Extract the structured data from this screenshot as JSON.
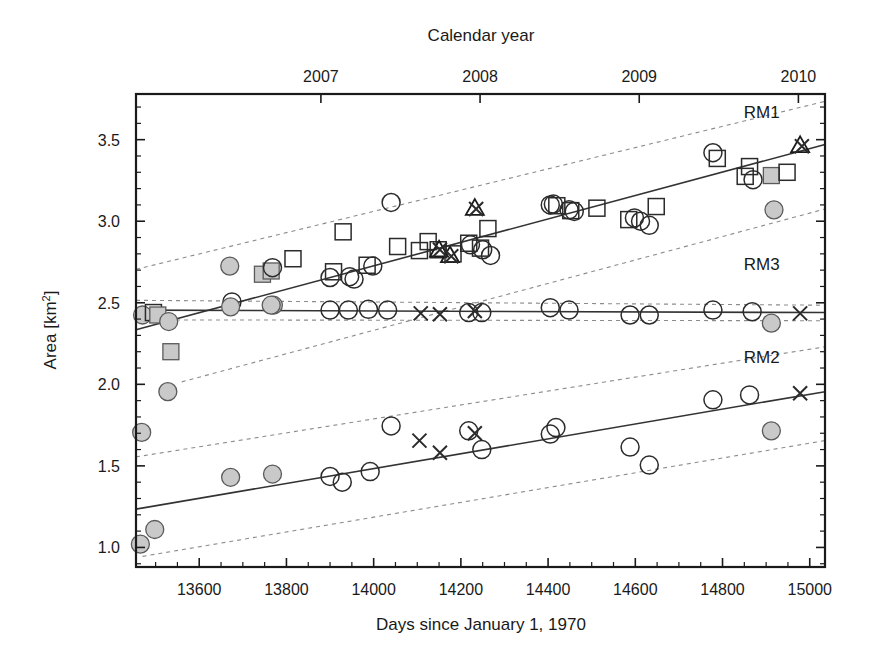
{
  "figure": {
    "background": "#ffffff",
    "ink_color": "#1a1a1a",
    "marker_fill_color": "#c9c9c9",
    "fit_line_color": "#333333",
    "ci_line_color": "#8c8c8c"
  },
  "chart_data": {
    "type": "scatter",
    "title": "",
    "xlabel": "Days since January 1, 1970",
    "ylabel": "Area [km²]",
    "top_axis_label": "Calendar year",
    "xlim": [
      13455,
      15035
    ],
    "ylim": [
      0.88,
      3.78
    ],
    "grid": false,
    "legend_position": "inline-right",
    "x_ticks_major": [
      13600,
      13800,
      14000,
      14200,
      14400,
      14600,
      14800,
      15000
    ],
    "x_tick_labels": [
      "13600",
      "13800",
      "14000",
      "14200",
      "14400",
      "14600",
      "14800",
      "15000"
    ],
    "x_minor_step": 50,
    "y_ticks_major": [
      1.0,
      1.5,
      2.0,
      2.5,
      3.0,
      3.5
    ],
    "y_tick_labels": [
      "1.0",
      "1.5",
      "2.0",
      "2.5",
      "3.0",
      "3.5"
    ],
    "y_minor_step": 0.1,
    "top_ticks": [
      13879,
      14244,
      14609,
      14974
    ],
    "top_tick_labels": [
      "2007",
      "2008",
      "2009",
      "2010"
    ],
    "series": [
      {
        "name": "RM1",
        "label": "RM1",
        "label_x": 14890,
        "label_y": 3.63,
        "fit": {
          "x1": 13455,
          "y1": 2.335,
          "x2": 15035,
          "y2": 3.47
        },
        "ci_upper": {
          "x1": 13455,
          "y1": 2.705,
          "x2": 15035,
          "y2": 3.735
        },
        "ci_lower": {
          "x1": 13560,
          "y1": 2.015,
          "x2": 15035,
          "y2": 3.075
        },
        "points": [
          {
            "x": 13470,
            "y": 2.425,
            "marker": "filled-circle"
          },
          {
            "x": 13495,
            "y": 2.44,
            "marker": "open-square"
          },
          {
            "x": 13505,
            "y": 2.425,
            "marker": "filled-square"
          },
          {
            "x": 13530,
            "y": 2.385,
            "marker": "filled-circle"
          },
          {
            "x": 13535,
            "y": 2.2,
            "marker": "filled-square"
          },
          {
            "x": 13670,
            "y": 2.725,
            "marker": "filled-circle"
          },
          {
            "x": 13675,
            "y": 2.505,
            "marker": "open-circle"
          },
          {
            "x": 13745,
            "y": 2.675,
            "marker": "filled-square"
          },
          {
            "x": 13765,
            "y": 2.695,
            "marker": "filled-square"
          },
          {
            "x": 13768,
            "y": 2.715,
            "marker": "open-circle"
          },
          {
            "x": 13770,
            "y": 2.485,
            "marker": "filled-circle"
          },
          {
            "x": 13815,
            "y": 2.77,
            "marker": "open-square"
          },
          {
            "x": 13900,
            "y": 2.655,
            "marker": "open-circle"
          },
          {
            "x": 13908,
            "y": 2.69,
            "marker": "open-square"
          },
          {
            "x": 13930,
            "y": 2.935,
            "marker": "open-square"
          },
          {
            "x": 13945,
            "y": 2.66,
            "marker": "open-circle"
          },
          {
            "x": 13955,
            "y": 2.645,
            "marker": "open-circle"
          },
          {
            "x": 13985,
            "y": 2.73,
            "marker": "open-square"
          },
          {
            "x": 13998,
            "y": 2.725,
            "marker": "open-circle"
          },
          {
            "x": 14040,
            "y": 3.115,
            "marker": "open-circle"
          },
          {
            "x": 14055,
            "y": 2.845,
            "marker": "open-square"
          },
          {
            "x": 14105,
            "y": 2.82,
            "marker": "open-square"
          },
          {
            "x": 14125,
            "y": 2.875,
            "marker": "open-square"
          },
          {
            "x": 14148,
            "y": 2.825,
            "marker": "open-square"
          },
          {
            "x": 14150,
            "y": 2.825,
            "marker": "open-triangle"
          },
          {
            "x": 14152,
            "y": 2.825,
            "marker": "cross"
          },
          {
            "x": 14175,
            "y": 2.79,
            "marker": "open-triangle"
          },
          {
            "x": 14178,
            "y": 2.785,
            "marker": "cross"
          },
          {
            "x": 14182,
            "y": 2.8,
            "marker": "open-square"
          },
          {
            "x": 14218,
            "y": 2.865,
            "marker": "open-square"
          },
          {
            "x": 14222,
            "y": 2.855,
            "marker": "open-circle"
          },
          {
            "x": 14232,
            "y": 3.08,
            "marker": "open-triangle"
          },
          {
            "x": 14235,
            "y": 3.075,
            "marker": "cross"
          },
          {
            "x": 14245,
            "y": 2.835,
            "marker": "open-square"
          },
          {
            "x": 14250,
            "y": 2.825,
            "marker": "open-circle"
          },
          {
            "x": 14262,
            "y": 2.955,
            "marker": "open-square"
          },
          {
            "x": 14268,
            "y": 2.79,
            "marker": "open-circle"
          },
          {
            "x": 14405,
            "y": 3.1,
            "marker": "open-circle"
          },
          {
            "x": 14412,
            "y": 3.105,
            "marker": "open-circle"
          },
          {
            "x": 14420,
            "y": 3.095,
            "marker": "open-square"
          },
          {
            "x": 14448,
            "y": 3.07,
            "marker": "open-circle"
          },
          {
            "x": 14452,
            "y": 3.065,
            "marker": "open-square"
          },
          {
            "x": 14460,
            "y": 3.06,
            "marker": "open-circle"
          },
          {
            "x": 14512,
            "y": 3.08,
            "marker": "open-square"
          },
          {
            "x": 14585,
            "y": 3.01,
            "marker": "open-square"
          },
          {
            "x": 14598,
            "y": 3.02,
            "marker": "open-circle"
          },
          {
            "x": 14612,
            "y": 3.0,
            "marker": "open-circle"
          },
          {
            "x": 14632,
            "y": 2.975,
            "marker": "open-circle"
          },
          {
            "x": 14648,
            "y": 3.09,
            "marker": "open-square"
          },
          {
            "x": 14778,
            "y": 3.42,
            "marker": "open-circle"
          },
          {
            "x": 14788,
            "y": 3.385,
            "marker": "open-square"
          },
          {
            "x": 14852,
            "y": 3.275,
            "marker": "open-square"
          },
          {
            "x": 14862,
            "y": 3.335,
            "marker": "open-square"
          },
          {
            "x": 14870,
            "y": 3.255,
            "marker": "open-circle"
          },
          {
            "x": 14912,
            "y": 3.28,
            "marker": "filled-square"
          },
          {
            "x": 14918,
            "y": 3.07,
            "marker": "filled-circle"
          },
          {
            "x": 14948,
            "y": 3.3,
            "marker": "open-square"
          },
          {
            "x": 14978,
            "y": 3.465,
            "marker": "open-triangle"
          },
          {
            "x": 14982,
            "y": 3.46,
            "marker": "cross"
          }
        ]
      },
      {
        "name": "RM3",
        "label": "RM3",
        "label_x": 14890,
        "label_y": 2.7,
        "fit": {
          "x1": 13455,
          "y1": 2.455,
          "x2": 15035,
          "y2": 2.44
        },
        "ci_upper": {
          "x1": 13455,
          "y1": 2.515,
          "x2": 15035,
          "y2": 2.485
        },
        "ci_lower": {
          "x1": 13455,
          "y1": 2.395,
          "x2": 15035,
          "y2": 2.39
        },
        "points": [
          {
            "x": 13672,
            "y": 2.475,
            "marker": "filled-circle"
          },
          {
            "x": 13765,
            "y": 2.485,
            "marker": "filled-circle"
          },
          {
            "x": 13900,
            "y": 2.455,
            "marker": "open-circle"
          },
          {
            "x": 13942,
            "y": 2.455,
            "marker": "open-circle"
          },
          {
            "x": 13988,
            "y": 2.46,
            "marker": "open-circle"
          },
          {
            "x": 14032,
            "y": 2.455,
            "marker": "open-circle"
          },
          {
            "x": 14108,
            "y": 2.435,
            "marker": "cross"
          },
          {
            "x": 14152,
            "y": 2.43,
            "marker": "cross"
          },
          {
            "x": 14218,
            "y": 2.44,
            "marker": "open-circle"
          },
          {
            "x": 14232,
            "y": 2.45,
            "marker": "cross"
          },
          {
            "x": 14248,
            "y": 2.44,
            "marker": "open-circle"
          },
          {
            "x": 14405,
            "y": 2.47,
            "marker": "open-circle"
          },
          {
            "x": 14448,
            "y": 2.455,
            "marker": "open-circle"
          },
          {
            "x": 14588,
            "y": 2.425,
            "marker": "open-circle"
          },
          {
            "x": 14632,
            "y": 2.425,
            "marker": "open-circle"
          },
          {
            "x": 14778,
            "y": 2.455,
            "marker": "open-circle"
          },
          {
            "x": 14868,
            "y": 2.445,
            "marker": "open-circle"
          },
          {
            "x": 14912,
            "y": 2.375,
            "marker": "filled-circle"
          },
          {
            "x": 14978,
            "y": 2.435,
            "marker": "cross"
          }
        ]
      },
      {
        "name": "RM2",
        "label": "RM2",
        "label_x": 14890,
        "label_y": 2.13,
        "fit": {
          "x1": 13455,
          "y1": 1.235,
          "x2": 15035,
          "y2": 1.955
        },
        "ci_upper": {
          "x1": 13455,
          "y1": 1.555,
          "x2": 15035,
          "y2": 2.23
        },
        "ci_lower": {
          "x1": 13470,
          "y1": 0.945,
          "x2": 15035,
          "y2": 1.655
        },
        "points": [
          {
            "x": 13465,
            "y": 1.02,
            "marker": "filled-circle"
          },
          {
            "x": 13468,
            "y": 1.705,
            "marker": "filled-circle"
          },
          {
            "x": 13498,
            "y": 1.11,
            "marker": "filled-circle"
          },
          {
            "x": 13528,
            "y": 1.955,
            "marker": "filled-circle"
          },
          {
            "x": 13672,
            "y": 1.43,
            "marker": "filled-circle"
          },
          {
            "x": 13768,
            "y": 1.45,
            "marker": "filled-circle"
          },
          {
            "x": 13900,
            "y": 1.435,
            "marker": "open-circle"
          },
          {
            "x": 13928,
            "y": 1.4,
            "marker": "open-circle"
          },
          {
            "x": 13992,
            "y": 1.465,
            "marker": "open-circle"
          },
          {
            "x": 14040,
            "y": 1.745,
            "marker": "open-circle"
          },
          {
            "x": 14105,
            "y": 1.655,
            "marker": "cross"
          },
          {
            "x": 14152,
            "y": 1.58,
            "marker": "cross"
          },
          {
            "x": 14218,
            "y": 1.715,
            "marker": "open-circle"
          },
          {
            "x": 14232,
            "y": 1.7,
            "marker": "cross"
          },
          {
            "x": 14248,
            "y": 1.6,
            "marker": "open-circle"
          },
          {
            "x": 14405,
            "y": 1.695,
            "marker": "open-circle"
          },
          {
            "x": 14418,
            "y": 1.735,
            "marker": "open-circle"
          },
          {
            "x": 14588,
            "y": 1.615,
            "marker": "open-circle"
          },
          {
            "x": 14632,
            "y": 1.505,
            "marker": "open-circle"
          },
          {
            "x": 14778,
            "y": 1.905,
            "marker": "open-circle"
          },
          {
            "x": 14862,
            "y": 1.935,
            "marker": "open-circle"
          },
          {
            "x": 14912,
            "y": 1.715,
            "marker": "filled-circle"
          },
          {
            "x": 14978,
            "y": 1.945,
            "marker": "cross"
          }
        ]
      }
    ]
  }
}
